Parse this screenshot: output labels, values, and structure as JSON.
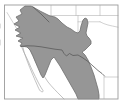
{
  "meta": {
    "kind": "species-range-map"
  },
  "colors": {
    "page_bg": "#ffffff",
    "frame": "#9b9b9b",
    "state_line": "#b4b4b4",
    "coast_line": "#a8a8a8",
    "range_fill": "#969696",
    "range_outline": "#6e6e6e",
    "border_line": "#5a5a5a",
    "artifact": "#c9c9c9"
  },
  "map": {
    "viewbox": "0 0 127 105",
    "features": [
      "map-frame",
      "state-boundaries",
      "california-nevada-border",
      "oklahoma-texas-panhandle-borders",
      "baja-california-coastline",
      "sonora-sinaloa-coastline",
      "mexican-state-boundaries",
      "shaded-range",
      "range-inner-boundary",
      "us-mexico-border-rio-grande"
    ],
    "paths": {
      "state_lines": "M7,12.5 L21.5,36.5 L20,40 L22.5,43.5 L21,46.5 M51,5.5 V18 M76,5.5 V15.5 M100,5.5 V15.5 M48,15.5 H118 M78,15.5 V46.5 M78,21.8 H100 M100,21.8 Q104,24 108,25 T118,27.2 M67,47.2 H78 M104,76.5 V98.5 M104.5,77 H118",
      "coastlines": "M21.5,46.5 C23,51 26,56 29,63 C31,68 34,74 38,82 C40,86 42,89 43,90.5 C43.8,92.2 41.2,92.4 39.5,90 C38,87 35,80 32,73 C29,66 26,58 24,52 L23,47.5 M29,47 C31,52 34,59 37,64 C40,70 44,76 48,82 C52,87 57,92 61,96 L64,99 M42,63 C40.5,66 42.6,69 41,72",
      "range": "M25,6 L31,6 L33,7 L40,11 L46,14 L50,16 L55,17 L58,19 L62,23 L67,27 L71,29 L75,32 L78,33 L80,31 L81,26 L83,20 L85,18 L87,19 L88,23 L87,28 L86,33 L87,36 L89,38 L91,41 L91,44 L88,47 L85,50 L82,52 L85,55 L88,60 L91,67 L94,75 L96,82 L98,89 L99,95 L99,99 L78,99 L76,94 L72,87 L68,80 L64,73 L60,66 L56,60 L54,57 L51,60 L49,65 L47,70 L45,75 L43,78 L41,75 L38,68 L35,61 L33,56 L30,50 L27,47 L24,46.5 L20,46 L22,43 L18,41 L23,38 L16,36 L21,33 L15,30 L20,27 L14,24 L19,21 L16,17 L22,14 L20,10 Z",
      "inner_line": "M33,7 L41,14 L49,22",
      "border": "M21,46.5 L27,45.8 L34,46 L41,46.8 L48,48 L55,49.2 L62,50 L64,53.5 L66.5,56 L69.5,53.5 L73,55.5 L78,55 L83,58 L88,61.5 L93,66 L98,70.5 L102,73.5 L104.5,76",
      "artifacts": "M0.5,24 V28 M0.5,40 V45"
    },
    "frame": {
      "x": 4.5,
      "y": 5,
      "w": 113.5,
      "h": 94
    }
  }
}
